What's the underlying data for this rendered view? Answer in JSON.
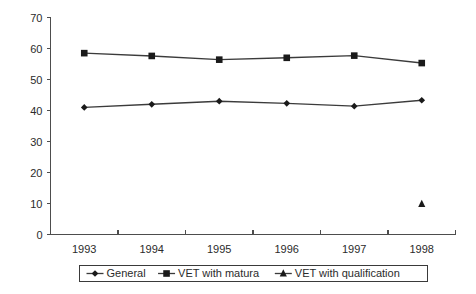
{
  "chart_data": {
    "type": "line",
    "title": "",
    "subtitle": "",
    "xlabel": "",
    "ylabel": "",
    "categories": [
      "1993",
      "1994",
      "1995",
      "1996",
      "1997",
      "1998"
    ],
    "x": [
      1993,
      1994,
      1995,
      1996,
      1997,
      1998
    ],
    "xlim": [
      1992.5,
      1998.5
    ],
    "ylim": [
      0,
      70
    ],
    "yticks": [
      0,
      10,
      20,
      30,
      40,
      50,
      60,
      70
    ],
    "ytick_labels": [
      "0",
      "10",
      "20",
      "30",
      "40",
      "50",
      "60",
      "70"
    ],
    "grid": false,
    "legend_position": "bottom",
    "series": [
      {
        "name": "General",
        "marker": "diamond",
        "color": "#1a1a1a",
        "values": [
          41.0,
          42.0,
          43.0,
          42.3,
          41.4,
          43.3
        ]
      },
      {
        "name": "VET with matura",
        "marker": "square",
        "color": "#1a1a1a",
        "values": [
          58.5,
          57.6,
          56.4,
          57.0,
          57.7,
          55.3
        ]
      },
      {
        "name": "VET with qualification",
        "marker": "triangle",
        "color": "#1a1a1a",
        "values": [
          null,
          null,
          null,
          null,
          null,
          9.8
        ]
      }
    ],
    "legend": [
      "General",
      "VET with matura",
      "VET with qualification"
    ]
  },
  "axes": {
    "y_tick_labels": [
      "70",
      "60",
      "50",
      "40",
      "30",
      "20",
      "10",
      "0"
    ],
    "x_tick_labels": [
      "1993",
      "1994",
      "1995",
      "1996",
      "1997",
      "1998"
    ]
  },
  "legend": {
    "items": [
      {
        "label": "General",
        "marker": "diamond"
      },
      {
        "label": "VET with matura",
        "marker": "square"
      },
      {
        "label": "VET with qualification",
        "marker": "triangle"
      }
    ]
  },
  "colors": {
    "axis": "#4d4d4d",
    "series": "#1a1a1a",
    "background": "#ffffff",
    "legend_border": "#3a3a3a"
  }
}
